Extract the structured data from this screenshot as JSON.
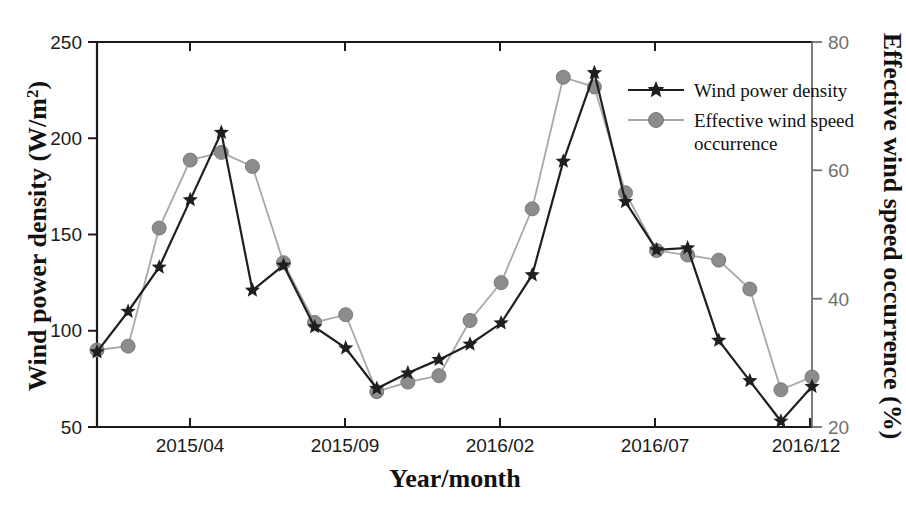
{
  "chart_data": {
    "type": "line",
    "title": "",
    "xlabel": "Year/month",
    "ylabel": "Wind power density (W/m2)",
    "ylabel_right": "Effective wind speed occurrence (%)",
    "grid": false,
    "legend_position": "upper-right-inside",
    "x": [
      "2015/01",
      "2015/02",
      "2015/03",
      "2015/04",
      "2015/05",
      "2015/06",
      "2015/07",
      "2015/08",
      "2015/09",
      "2015/10",
      "2015/11",
      "2015/12",
      "2016/01",
      "2016/02",
      "2016/03",
      "2016/04",
      "2016/05",
      "2016/06",
      "2016/07",
      "2016/08",
      "2016/09",
      "2016/10",
      "2016/11",
      "2016/12"
    ],
    "xtick_labels": [
      "2015/04",
      "2015/09",
      "2016/02",
      "2016/07",
      "2016/12"
    ],
    "xtick_positions": [
      "2015/04",
      "2015/09",
      "2016/02",
      "2016/07",
      "2016/12"
    ],
    "xlim": [
      "2015/01",
      "2016/12"
    ],
    "ylim": [
      50,
      250
    ],
    "ytick_labels": [
      "50",
      "100",
      "150",
      "200",
      "250"
    ],
    "ytick_values": [
      50,
      100,
      150,
      200,
      250
    ],
    "ylim_right": [
      20,
      80
    ],
    "ytick_labels_right": [
      "20",
      "40",
      "60",
      "80"
    ],
    "ytick_values_right": [
      20,
      40,
      60,
      80
    ],
    "series": [
      {
        "name": "Wind power density",
        "axis": "left",
        "marker": "star",
        "color": "#1f1f1f",
        "values": [
          89,
          110,
          133,
          168,
          203,
          121,
          134,
          102,
          91,
          70,
          78,
          85,
          93,
          104,
          129,
          188,
          234,
          167,
          142,
          143,
          95,
          74,
          53,
          71
        ]
      },
      {
        "name": "Effective wind speed occurrence",
        "axis": "right",
        "marker": "circle",
        "color": "#8c8c8c",
        "values": [
          32.0,
          32.6,
          51.0,
          61.6,
          62.8,
          60.6,
          45.6,
          36.3,
          37.5,
          25.5,
          27.0,
          28.0,
          36.6,
          42.5,
          54.0,
          74.5,
          73.0,
          56.5,
          47.5,
          46.8,
          46.0,
          41.5,
          25.8,
          27.8
        ]
      }
    ]
  },
  "legend": {
    "items": [
      {
        "label": "Wind power density",
        "marker": "star",
        "color": "#1f1f1f"
      },
      {
        "label": "Effective wind speed occurrence",
        "label_line1": "Effective wind speed",
        "label_line2": "occurrence",
        "marker": "circle",
        "color": "#8c8c8c"
      }
    ]
  },
  "axes": {
    "left_title_main": "Wind power density (W/m",
    "left_title_sup": "2",
    "left_title_close": ")",
    "right_title": "Effective wind speed occurrence (%)",
    "bottom_title": "Year/month"
  }
}
